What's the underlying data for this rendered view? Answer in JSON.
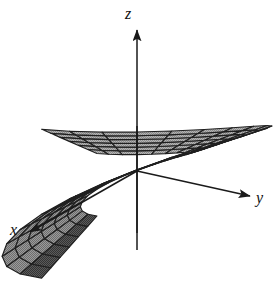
{
  "figure": {
    "kind": "3d-surface-plot",
    "background_color": "#ffffff",
    "width": 276,
    "height": 305
  },
  "axes": {
    "origin": {
      "x": 137,
      "y": 171
    },
    "items": [
      {
        "name": "z",
        "label": "z",
        "tip": {
          "x": 137,
          "y": 30
        },
        "tail": {
          "x": 137,
          "y": 250
        },
        "label_pos": {
          "x": 125,
          "y": 6
        }
      },
      {
        "name": "y",
        "label": "y",
        "tip": {
          "x": 250,
          "y": 196
        },
        "tail": {
          "x": 137,
          "y": 171
        },
        "label_pos": {
          "x": 256,
          "y": 190
        }
      },
      {
        "name": "x",
        "label": "x",
        "tip": {
          "x": 30,
          "y": 232
        },
        "tail": {
          "x": 137,
          "y": 171
        },
        "label_pos": {
          "x": 10,
          "y": 222
        }
      }
    ],
    "line_color": "#1a1a1a",
    "arrowhead": "filled-triangle"
  },
  "surface": {
    "mesh_line_color": "#1f1f1f",
    "fill_light": "#a9a9a9",
    "fill_mid": "#8f8f8f",
    "fill_dark": "#4a4a4a",
    "fill_darkest": "#262626",
    "hole_fill": "#ffffff",
    "u_divisions": 24,
    "v_divisions": 6,
    "inner_radius": 0.42,
    "outer_radius": 1.0,
    "twist_turns": 1
  },
  "chart_data": {
    "type": "surface",
    "title": "",
    "xlabel": "x",
    "ylabel": "y",
    "zlabel": "z",
    "grid": false,
    "legend": null,
    "parametric": {
      "u_range": [
        0,
        6.2832
      ],
      "v_range": [
        0.42,
        1.0
      ],
      "equations": [
        "x = v*cos(u)",
        "y = v*sin(u)",
        "z = 0.55*v*cos(u/2)"
      ]
    },
    "view": {
      "azimuth_deg": 28,
      "elevation_deg": 18
    },
    "annotations": [
      "z",
      "y",
      "x"
    ]
  }
}
